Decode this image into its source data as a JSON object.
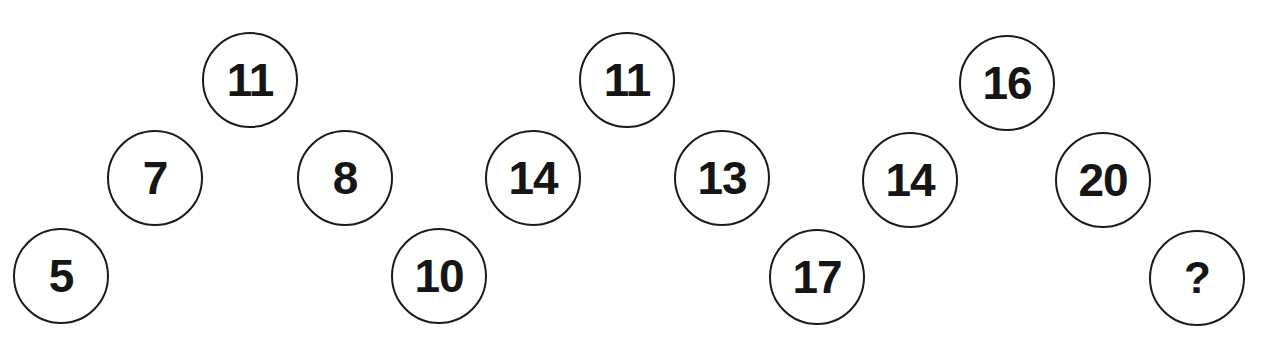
{
  "puzzle": {
    "style": {
      "circle_stroke": "#1a1a1a",
      "text_color": "#151515",
      "background": "#ffffff"
    },
    "groups": [
      {
        "name": "group-1",
        "nodes": [
          {
            "position": "top",
            "value": "11",
            "x": 250,
            "y": 80
          },
          {
            "position": "middle-left",
            "value": "7",
            "x": 155,
            "y": 178
          },
          {
            "position": "middle-right",
            "value": "8",
            "x": 345,
            "y": 178
          },
          {
            "position": "bottom-left",
            "value": "5",
            "x": 61,
            "y": 276
          }
        ]
      },
      {
        "name": "group-2",
        "nodes": [
          {
            "position": "top",
            "value": "11",
            "x": 627,
            "y": 80
          },
          {
            "position": "middle-left",
            "value": "14",
            "x": 533,
            "y": 178
          },
          {
            "position": "middle-right",
            "value": "13",
            "x": 722,
            "y": 178
          },
          {
            "position": "bottom-left",
            "value": "10",
            "x": 439,
            "y": 276
          }
        ]
      },
      {
        "name": "group-3",
        "nodes": [
          {
            "position": "top",
            "value": "16",
            "x": 1007,
            "y": 83
          },
          {
            "position": "middle-left",
            "value": "14",
            "x": 910,
            "y": 180
          },
          {
            "position": "middle-right",
            "value": "20",
            "x": 1103,
            "y": 180
          },
          {
            "position": "bottom-left",
            "value": "17",
            "x": 817,
            "y": 277
          },
          {
            "position": "bottom-right",
            "value": "?",
            "x": 1197,
            "y": 278
          }
        ]
      }
    ]
  }
}
